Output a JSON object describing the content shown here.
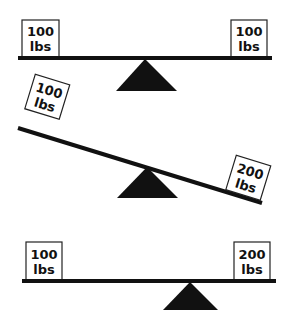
{
  "diagram": {
    "type": "seesaw-balance-comparison",
    "panels": [
      {
        "name": "balanced-equal-weights",
        "left_weight": {
          "value": "100",
          "unit": "lbs"
        },
        "right_weight": {
          "value": "100",
          "unit": "lbs"
        },
        "state": "level"
      },
      {
        "name": "tilted-unequal-weights",
        "left_weight": {
          "value": "100",
          "unit": "lbs"
        },
        "right_weight": {
          "value": "200",
          "unit": "lbs"
        },
        "state": "tilted-right-down"
      },
      {
        "name": "balanced-shifted-fulcrum",
        "left_weight": {
          "value": "100",
          "unit": "lbs"
        },
        "right_weight": {
          "value": "200",
          "unit": "lbs"
        },
        "state": "level-fulcrum-shifted"
      }
    ],
    "colors": {
      "beam": "#111111",
      "fulcrum": "#111111",
      "box_border": "#222222",
      "box_fill": "#ffffff"
    }
  }
}
